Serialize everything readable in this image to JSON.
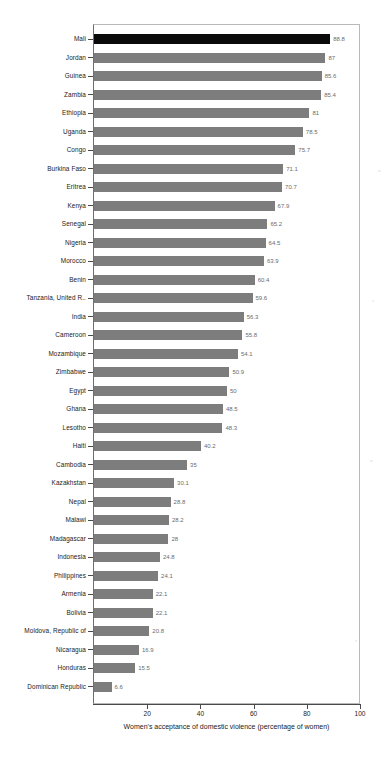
{
  "chart_data": {
    "type": "bar",
    "orientation": "horizontal",
    "title": "",
    "subtitle": "",
    "xlabel": "Women's acceptance of domestic violence (percentage of women)",
    "ylabel": "",
    "xlim": [
      0,
      100
    ],
    "xticks": [
      20,
      40,
      60,
      80,
      100
    ],
    "xtick_labels": [
      "20",
      "40",
      "60",
      "80",
      "100"
    ],
    "grid": false,
    "legend": null,
    "highlight_category": "Mali",
    "bar_color": "#7d7d7d",
    "highlight_color": "#0a0a0a",
    "value_label_color": "#6b6b6b",
    "categories": [
      "Mali",
      "Jordan",
      "Guinea",
      "Zambia",
      "Ethiopia",
      "Uganda",
      "Congo",
      "Burkina Faso",
      "Eritrea",
      "Kenya",
      "Senegal",
      "Nigeria",
      "Morocco",
      "Benin",
      "Tanzania, United R..",
      "India",
      "Cameroon",
      "Mozambique",
      "Zimbabwe",
      "Egypt",
      "Ghana",
      "Lesotho",
      "Haiti",
      "Cambodia",
      "Kazakhstan",
      "Nepal",
      "Malawi",
      "Madagascar",
      "Indonesia",
      "Philippines",
      "Armenia",
      "Bolivia",
      "Moldova, Republic of",
      "Nicaragua",
      "Honduras",
      "Dominican Republic"
    ],
    "values": [
      88.8,
      87,
      85.6,
      85.4,
      81,
      78.5,
      75.7,
      71.1,
      70.7,
      67.9,
      65.2,
      64.5,
      63.9,
      60.4,
      59.6,
      56.3,
      55.8,
      54.1,
      50.9,
      50,
      48.5,
      48.3,
      40.2,
      35,
      30.1,
      28.8,
      28.2,
      28,
      24.8,
      24.1,
      22.1,
      22.1,
      20.8,
      16.9,
      15.5,
      6.6
    ],
    "value_labels": [
      "88.8",
      "87",
      "85.6",
      "85.4",
      "81",
      "78.5",
      "75.7",
      "71.1",
      "70.7",
      "67.9",
      "65.2",
      "64.5",
      "63.9",
      "60.4",
      "59.6",
      "56.3",
      "55.8",
      "54.1",
      "50.9",
      "50",
      "48.5",
      "48.3",
      "40.2",
      "35",
      "30.1",
      "28.8",
      "28.2",
      "28",
      "24.8",
      "24.1",
      "22.1",
      "22.1",
      "20.8",
      "16.9",
      "15.5",
      "6.6"
    ]
  }
}
